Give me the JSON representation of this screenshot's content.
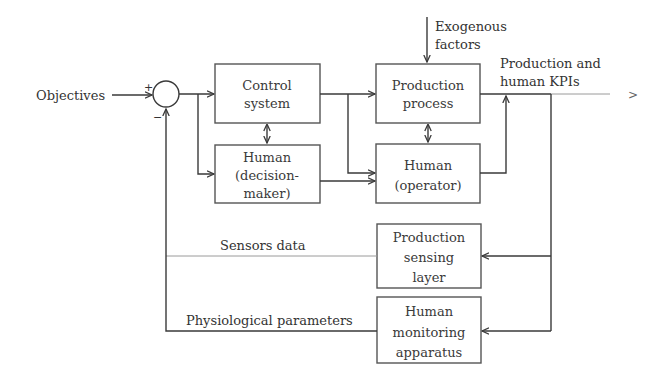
{
  "diagram": {
    "input_label": "Objectives",
    "summing_junction": {
      "plus_sign": "+",
      "minus_sign": "−"
    },
    "blocks": {
      "control_system": [
        "Control",
        "system"
      ],
      "human_decision_maker": [
        "Human",
        "(decision-",
        "maker)"
      ],
      "production_process": [
        "Production",
        "process"
      ],
      "human_operator": [
        "Human",
        "(operator)"
      ],
      "production_sensing_layer": [
        "Production",
        "sensing",
        "layer"
      ],
      "human_monitoring_apparatus": [
        "Human",
        "monitoring",
        "apparatus"
      ]
    },
    "labels": {
      "exogenous": [
        "Exogenous",
        "factors"
      ],
      "output": [
        "Production and",
        "human KPIs"
      ],
      "output_arrow": ">",
      "sensors_data": "Sensors data",
      "physiological": "Physiological parameters"
    }
  }
}
